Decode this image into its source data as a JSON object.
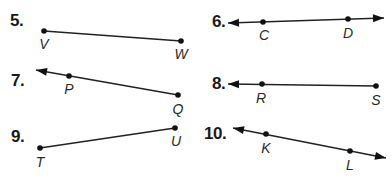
{
  "colors": {
    "background": "#ffffff",
    "stroke": "#222222",
    "point": "#111111",
    "text": "#1a1a1a"
  },
  "problems": [
    {
      "number": "5.",
      "type": "segment",
      "label_pos": [
        10,
        12
      ],
      "points": [
        {
          "name": "V",
          "x": 44,
          "y": 31,
          "label_x": 44,
          "label_y": 37
        },
        {
          "name": "W",
          "x": 181,
          "y": 41,
          "label_x": 181,
          "label_y": 47
        }
      ],
      "arrows": []
    },
    {
      "number": "6.",
      "type": "line",
      "label_pos": [
        212,
        13
      ],
      "points": [
        {
          "name": "C",
          "x": 263,
          "y": 22,
          "label_x": 264,
          "label_y": 28
        },
        {
          "name": "D",
          "x": 348,
          "y": 19,
          "label_x": 348,
          "label_y": 26
        }
      ],
      "arrows": [
        {
          "tip_x": 228,
          "tip_y": 23
        },
        {
          "tip_x": 384,
          "tip_y": 18
        }
      ]
    },
    {
      "number": "7.",
      "type": "ray",
      "label_pos": [
        11,
        72
      ],
      "points": [
        {
          "name": "P",
          "x": 69,
          "y": 76,
          "label_x": 69,
          "label_y": 82
        },
        {
          "name": "Q",
          "x": 178,
          "y": 95,
          "label_x": 178,
          "label_y": 102
        }
      ],
      "arrows": [
        {
          "tip_x": 36,
          "tip_y": 70
        }
      ]
    },
    {
      "number": "8.",
      "type": "ray",
      "label_pos": [
        212,
        75
      ],
      "points": [
        {
          "name": "R",
          "x": 262,
          "y": 84,
          "label_x": 261,
          "label_y": 91
        },
        {
          "name": "S",
          "x": 376,
          "y": 86,
          "label_x": 376,
          "label_y": 93
        }
      ],
      "arrows": [
        {
          "tip_x": 228,
          "tip_y": 84
        }
      ]
    },
    {
      "number": "9.",
      "type": "segment",
      "label_pos": [
        11,
        128
      ],
      "points": [
        {
          "name": "T",
          "x": 40,
          "y": 148,
          "label_x": 40,
          "label_y": 155
        },
        {
          "name": "U",
          "x": 175,
          "y": 128,
          "label_x": 176,
          "label_y": 134
        }
      ],
      "arrows": []
    },
    {
      "number": "10.",
      "type": "line",
      "label_pos": [
        204,
        125
      ],
      "points": [
        {
          "name": "K",
          "x": 266,
          "y": 134,
          "label_x": 266,
          "label_y": 141
        },
        {
          "name": "L",
          "x": 350,
          "y": 151,
          "label_x": 350,
          "label_y": 158
        }
      ],
      "arrows": [
        {
          "tip_x": 233,
          "tip_y": 128
        },
        {
          "tip_x": 386,
          "tip_y": 158
        }
      ]
    }
  ]
}
